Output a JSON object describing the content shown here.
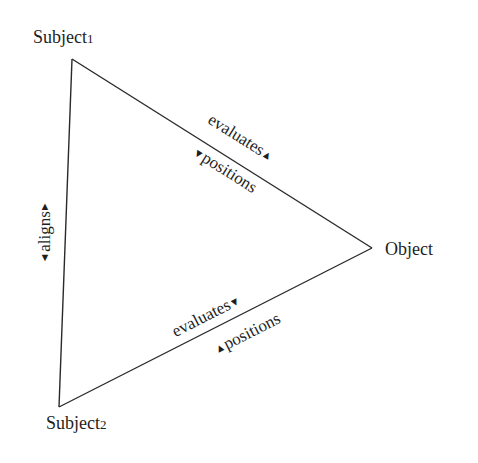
{
  "diagram": {
    "type": "triangle-relation",
    "line_color": "#2a2a2a",
    "nodes": {
      "subject1": {
        "label": "Subject",
        "suffix": "1"
      },
      "subject2": {
        "label": "Subject",
        "suffix": "2"
      },
      "object": {
        "label": "Object"
      }
    },
    "edges": {
      "subject1_object": {
        "upper": {
          "text": "evaluates",
          "arrow": "▲"
        },
        "lower": {
          "text": "positions",
          "arrow": "▼"
        }
      },
      "subject2_object": {
        "upper": {
          "text": "evaluates",
          "arrow": "▼"
        },
        "lower": {
          "text": "positions",
          "arrow": "▲"
        }
      },
      "subject1_subject2": {
        "label": {
          "text": "aligns",
          "arrow_start": "▼",
          "arrow_end": "▲"
        }
      }
    }
  }
}
